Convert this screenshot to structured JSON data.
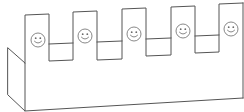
{
  "figure": {
    "colors": {
      "line": "#555555",
      "face_line": "#6a6a6a",
      "background": "#ffffff"
    },
    "box": {
      "left_side_face": [
        [
          8,
          48
        ],
        [
          25,
          63
        ],
        [
          25,
          111
        ],
        [
          8,
          95
        ]
      ],
      "front_bottom_edge": [
        [
          25,
          111
        ],
        [
          243,
          98
        ]
      ],
      "right_edge": [
        [
          243,
          3
        ],
        [
          243,
          98
        ]
      ]
    },
    "crenellation_outline": [
      [
        25,
        63
      ],
      [
        25,
        15
      ],
      [
        49,
        14
      ],
      [
        49,
        61
      ],
      [
        73,
        60
      ],
      [
        73,
        12
      ],
      [
        97,
        11
      ],
      [
        97,
        60
      ],
      [
        122,
        59
      ],
      [
        122,
        9
      ],
      [
        146,
        8
      ],
      [
        146,
        56
      ],
      [
        171,
        55
      ],
      [
        171,
        7
      ],
      [
        195,
        6
      ],
      [
        195,
        53
      ],
      [
        219,
        52
      ],
      [
        219,
        4
      ],
      [
        243,
        3
      ]
    ],
    "gap_back_lines": [
      [
        [
          49,
          44
        ],
        [
          73,
          43
        ]
      ],
      [
        [
          97,
          42
        ],
        [
          122,
          41
        ]
      ],
      [
        [
          146,
          39
        ],
        [
          171,
          38
        ]
      ],
      [
        [
          195,
          36
        ],
        [
          219,
          35
        ]
      ]
    ],
    "tabs": [
      {
        "label": "tab-1",
        "smiley": {
          "cx": 38,
          "cy": 40,
          "r": 7
        }
      },
      {
        "label": "tab-2",
        "smiley": {
          "cx": 85,
          "cy": 36,
          "r": 7
        }
      },
      {
        "label": "tab-3",
        "smiley": {
          "cx": 134,
          "cy": 34,
          "r": 7
        }
      },
      {
        "label": "tab-4",
        "smiley": {
          "cx": 183,
          "cy": 31,
          "r": 7
        }
      },
      {
        "label": "tab-5",
        "smiley": {
          "cx": 231,
          "cy": 29,
          "r": 7
        }
      }
    ]
  }
}
